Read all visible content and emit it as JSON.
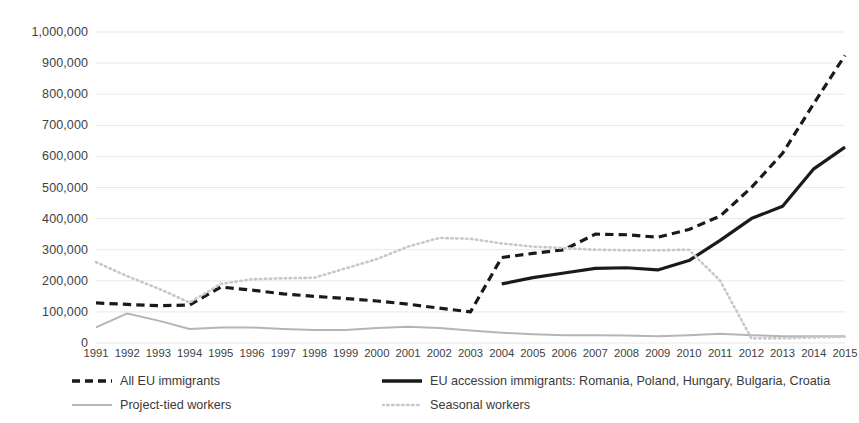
{
  "chart_data": {
    "type": "line",
    "title": "",
    "xlabel": "",
    "ylabel": "",
    "x": [
      1991,
      1992,
      1993,
      1994,
      1995,
      1996,
      1997,
      1998,
      1999,
      2000,
      2001,
      2002,
      2003,
      2004,
      2005,
      2006,
      2007,
      2008,
      2009,
      2010,
      2011,
      2012,
      2013,
      2014,
      2015
    ],
    "xlim": [
      1991,
      2015
    ],
    "ylim": [
      0,
      1000000
    ],
    "ytick_values": [
      0,
      100000,
      200000,
      300000,
      400000,
      500000,
      600000,
      700000,
      800000,
      900000,
      1000000
    ],
    "ytick_labels": [
      "0",
      "100,000",
      "200,000",
      "300,000",
      "400,000",
      "500,000",
      "600,000",
      "700,000",
      "800,000",
      "900,000",
      "1,000,000"
    ],
    "xtick_labels": [
      "1991",
      "1992",
      "1993",
      "1994",
      "1995",
      "1996",
      "1997",
      "1998",
      "1999",
      "2000",
      "2001",
      "2002",
      "2003",
      "2004",
      "2005",
      "2006",
      "2007",
      "2008",
      "2009",
      "2010",
      "2011",
      "2012",
      "2013",
      "2014",
      "2015"
    ],
    "grid": true,
    "grid_axis": "y",
    "legend_position": "bottom",
    "series": [
      {
        "name": "All EU immigrants",
        "style": "dashed",
        "color": "#1a1a1a",
        "width": 3.2,
        "values": [
          129000,
          124000,
          120000,
          122000,
          180000,
          170000,
          158000,
          150000,
          143000,
          135000,
          125000,
          112000,
          100000,
          275000,
          288000,
          300000,
          350000,
          348000,
          340000,
          365000,
          408000,
          500000,
          610000,
          770000,
          925000
        ]
      },
      {
        "name": "EU accession immigrants: Romania, Poland, Hungary, Bulgaria, Croatia",
        "style": "solid",
        "color": "#1a1a1a",
        "width": 3.2,
        "values": [
          null,
          null,
          null,
          null,
          null,
          null,
          null,
          null,
          null,
          null,
          null,
          null,
          null,
          190000,
          210000,
          225000,
          240000,
          242000,
          235000,
          265000,
          330000,
          400000,
          440000,
          560000,
          630000
        ]
      },
      {
        "name": "Project-tied workers",
        "style": "solid",
        "color": "#b5b5b5",
        "width": 2.0,
        "values": [
          50000,
          95000,
          72000,
          45000,
          50000,
          50000,
          45000,
          42000,
          42000,
          48000,
          52000,
          48000,
          40000,
          33000,
          28000,
          25000,
          25000,
          24000,
          22000,
          25000,
          30000,
          25000,
          22000,
          22000,
          22000
        ]
      },
      {
        "name": "Seasonal workers",
        "style": "dotted",
        "color": "#c8c8c8",
        "width": 2.6,
        "values": [
          260000,
          215000,
          175000,
          130000,
          190000,
          205000,
          208000,
          210000,
          240000,
          270000,
          310000,
          338000,
          335000,
          320000,
          310000,
          305000,
          300000,
          298000,
          298000,
          300000,
          200000,
          15000,
          15000,
          18000,
          20000
        ]
      }
    ]
  },
  "legend": {
    "items": [
      {
        "label": "All EU immigrants",
        "swatch": "dashed-black-line-icon"
      },
      {
        "label": "EU accession immigrants: Romania, Poland, Hungary, Bulgaria, Croatia",
        "swatch": "solid-black-line-icon"
      },
      {
        "label": "Project-tied workers",
        "swatch": "solid-gray-line-icon"
      },
      {
        "label": "Seasonal workers",
        "swatch": "dotted-gray-line-icon"
      }
    ]
  }
}
